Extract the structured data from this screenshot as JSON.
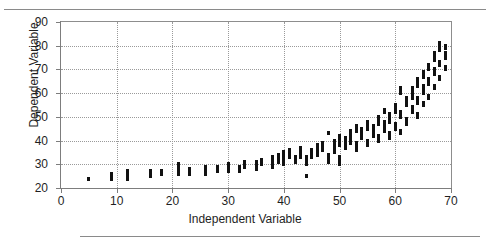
{
  "figure": {
    "has_top_rule": true,
    "has_bottom_rule": true,
    "background_color": "#ffffff",
    "marker_color": "#111111",
    "axis_color": "#7d7d7d",
    "grid_color": "#9a9a9a"
  },
  "axis": {
    "x_title": "Independent Variable",
    "y_title": "Dependent Variable",
    "x_ticks": [
      "0",
      "10",
      "20",
      "30",
      "40",
      "50",
      "60",
      "70"
    ],
    "y_ticks": [
      "20",
      "30",
      "40",
      "50",
      "60",
      "70",
      "80",
      "90"
    ]
  },
  "chart_data": {
    "type": "scatter",
    "title": "",
    "xlabel": "Independent Variable",
    "ylabel": "Dependent Variable",
    "xlim": [
      0,
      70
    ],
    "ylim": [
      20,
      90
    ],
    "xticks": [
      0,
      10,
      20,
      30,
      40,
      50,
      60,
      70
    ],
    "yticks": [
      20,
      30,
      40,
      50,
      60,
      70,
      80,
      90
    ],
    "grid": true,
    "legend": null,
    "marker": "square",
    "series": [
      {
        "name": "observations",
        "points": [
          [
            5,
            24
          ],
          [
            9,
            24
          ],
          [
            9,
            25
          ],
          [
            9,
            26
          ],
          [
            12,
            24
          ],
          [
            12,
            25
          ],
          [
            12,
            26
          ],
          [
            12,
            27
          ],
          [
            16,
            25
          ],
          [
            16,
            26
          ],
          [
            16,
            27
          ],
          [
            18,
            26
          ],
          [
            18,
            27
          ],
          [
            21,
            26
          ],
          [
            21,
            27
          ],
          [
            21,
            28
          ],
          [
            21,
            29
          ],
          [
            21,
            30
          ],
          [
            23,
            26
          ],
          [
            23,
            27
          ],
          [
            23,
            28
          ],
          [
            26,
            26
          ],
          [
            26,
            27
          ],
          [
            26,
            28
          ],
          [
            26,
            29
          ],
          [
            28,
            27
          ],
          [
            28,
            28
          ],
          [
            28,
            29
          ],
          [
            30,
            27
          ],
          [
            30,
            28
          ],
          [
            30,
            29
          ],
          [
            30,
            30
          ],
          [
            32,
            27
          ],
          [
            32,
            28
          ],
          [
            32,
            29
          ],
          [
            33,
            29
          ],
          [
            33,
            30
          ],
          [
            33,
            31
          ],
          [
            35,
            28
          ],
          [
            35,
            29
          ],
          [
            35,
            30
          ],
          [
            35,
            31
          ],
          [
            36,
            30
          ],
          [
            36,
            31
          ],
          [
            36,
            32
          ],
          [
            38,
            29
          ],
          [
            38,
            30
          ],
          [
            38,
            31
          ],
          [
            38,
            32
          ],
          [
            38,
            33
          ],
          [
            39,
            31
          ],
          [
            39,
            32
          ],
          [
            39,
            33
          ],
          [
            39,
            34
          ],
          [
            40,
            30
          ],
          [
            40,
            31
          ],
          [
            40,
            32
          ],
          [
            40,
            33
          ],
          [
            40,
            34
          ],
          [
            40,
            35
          ],
          [
            41,
            33
          ],
          [
            41,
            34
          ],
          [
            41,
            35
          ],
          [
            41,
            36
          ],
          [
            42,
            31
          ],
          [
            42,
            32
          ],
          [
            42,
            33
          ],
          [
            43,
            33
          ],
          [
            43,
            34
          ],
          [
            43,
            35
          ],
          [
            43,
            36
          ],
          [
            43,
            37
          ],
          [
            44,
            30
          ],
          [
            44,
            31
          ],
          [
            44,
            32
          ],
          [
            44,
            33
          ],
          [
            44,
            25
          ],
          [
            45,
            33
          ],
          [
            45,
            34
          ],
          [
            45,
            35
          ],
          [
            45,
            36
          ],
          [
            46,
            34
          ],
          [
            46,
            35
          ],
          [
            46,
            36
          ],
          [
            46,
            37
          ],
          [
            46,
            38
          ],
          [
            47,
            36
          ],
          [
            47,
            37
          ],
          [
            47,
            38
          ],
          [
            47,
            39
          ],
          [
            48,
            31
          ],
          [
            48,
            32
          ],
          [
            48,
            33
          ],
          [
            48,
            34
          ],
          [
            48,
            43
          ],
          [
            49,
            35
          ],
          [
            49,
            36
          ],
          [
            49,
            37
          ],
          [
            49,
            38
          ],
          [
            49,
            39
          ],
          [
            49,
            40
          ],
          [
            50,
            30
          ],
          [
            50,
            31
          ],
          [
            50,
            32
          ],
          [
            50,
            33
          ],
          [
            50,
            38
          ],
          [
            50,
            39
          ],
          [
            50,
            40
          ],
          [
            50,
            41
          ],
          [
            50,
            42
          ],
          [
            51,
            37
          ],
          [
            51,
            38
          ],
          [
            51,
            39
          ],
          [
            51,
            40
          ],
          [
            51,
            41
          ],
          [
            52,
            39
          ],
          [
            52,
            40
          ],
          [
            52,
            41
          ],
          [
            52,
            42
          ],
          [
            52,
            43
          ],
          [
            52,
            44
          ],
          [
            53,
            36
          ],
          [
            53,
            37
          ],
          [
            53,
            38
          ],
          [
            53,
            39
          ],
          [
            53,
            44
          ],
          [
            53,
            45
          ],
          [
            53,
            46
          ],
          [
            54,
            41
          ],
          [
            54,
            42
          ],
          [
            54,
            43
          ],
          [
            54,
            44
          ],
          [
            54,
            45
          ],
          [
            55,
            38
          ],
          [
            55,
            39
          ],
          [
            55,
            40
          ],
          [
            55,
            45
          ],
          [
            55,
            46
          ],
          [
            55,
            47
          ],
          [
            55,
            48
          ],
          [
            56,
            42
          ],
          [
            56,
            43
          ],
          [
            56,
            44
          ],
          [
            56,
            45
          ],
          [
            56,
            46
          ],
          [
            57,
            40
          ],
          [
            57,
            41
          ],
          [
            57,
            42
          ],
          [
            57,
            47
          ],
          [
            57,
            48
          ],
          [
            57,
            49
          ],
          [
            57,
            50
          ],
          [
            58,
            44
          ],
          [
            58,
            45
          ],
          [
            58,
            46
          ],
          [
            58,
            47
          ],
          [
            58,
            48
          ],
          [
            58,
            52
          ],
          [
            58,
            53
          ],
          [
            59,
            41
          ],
          [
            59,
            42
          ],
          [
            59,
            43
          ],
          [
            59,
            48
          ],
          [
            59,
            49
          ],
          [
            59,
            50
          ],
          [
            59,
            51
          ],
          [
            60,
            45
          ],
          [
            60,
            46
          ],
          [
            60,
            47
          ],
          [
            60,
            52
          ],
          [
            60,
            53
          ],
          [
            60,
            54
          ],
          [
            60,
            55
          ],
          [
            61,
            43
          ],
          [
            61,
            44
          ],
          [
            61,
            50
          ],
          [
            61,
            51
          ],
          [
            61,
            52
          ],
          [
            61,
            60
          ],
          [
            61,
            61
          ],
          [
            61,
            62
          ],
          [
            62,
            47
          ],
          [
            62,
            48
          ],
          [
            62,
            49
          ],
          [
            62,
            55
          ],
          [
            62,
            56
          ],
          [
            62,
            57
          ],
          [
            62,
            58
          ],
          [
            63,
            52
          ],
          [
            63,
            53
          ],
          [
            63,
            54
          ],
          [
            63,
            58
          ],
          [
            63,
            59
          ],
          [
            63,
            60
          ],
          [
            63,
            61
          ],
          [
            63,
            62
          ],
          [
            64,
            50
          ],
          [
            64,
            51
          ],
          [
            64,
            56
          ],
          [
            64,
            57
          ],
          [
            64,
            58
          ],
          [
            64,
            63
          ],
          [
            64,
            64
          ],
          [
            64,
            65
          ],
          [
            64,
            66
          ],
          [
            65,
            55
          ],
          [
            65,
            56
          ],
          [
            65,
            60
          ],
          [
            65,
            61
          ],
          [
            65,
            62
          ],
          [
            65,
            63
          ],
          [
            65,
            67
          ],
          [
            65,
            68
          ],
          [
            65,
            69
          ],
          [
            66,
            58
          ],
          [
            66,
            59
          ],
          [
            66,
            64
          ],
          [
            66,
            65
          ],
          [
            66,
            66
          ],
          [
            66,
            70
          ],
          [
            66,
            71
          ],
          [
            66,
            72
          ],
          [
            67,
            62
          ],
          [
            67,
            63
          ],
          [
            67,
            68
          ],
          [
            67,
            69
          ],
          [
            67,
            70
          ],
          [
            67,
            74
          ],
          [
            67,
            75
          ],
          [
            67,
            76
          ],
          [
            67,
            77
          ],
          [
            68,
            66
          ],
          [
            68,
            67
          ],
          [
            68,
            72
          ],
          [
            68,
            73
          ],
          [
            68,
            78
          ],
          [
            68,
            79
          ],
          [
            68,
            80
          ],
          [
            68,
            81
          ],
          [
            69,
            70
          ],
          [
            69,
            71
          ],
          [
            69,
            75
          ],
          [
            69,
            76
          ],
          [
            69,
            77
          ],
          [
            69,
            79
          ],
          [
            69,
            80
          ]
        ]
      }
    ]
  }
}
